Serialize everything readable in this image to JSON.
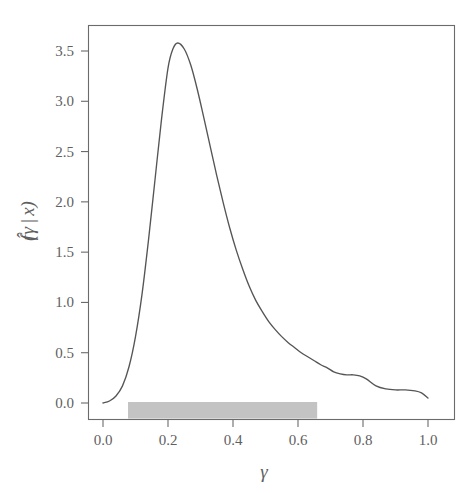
{
  "figure": {
    "background_color": "#ffffff",
    "frame_color": "#6b6b6b",
    "text_color": "#5f5f5f"
  },
  "chart_data": {
    "type": "line",
    "title": "",
    "subtitle": "",
    "xlabel": "γ",
    "ylabel": "f̂(γ | x)",
    "ylabel_parts": {
      "function": "f",
      "hat": "̂",
      "open_paren": "(",
      "variable": "γ",
      "bar": "|",
      "conditional": "x",
      "close_paren": ")"
    },
    "xlim": [
      -0.04,
      1.06
    ],
    "ylim": [
      -0.16,
      3.78
    ],
    "xticks": [
      0.0,
      0.2,
      0.4,
      0.6,
      0.8,
      1.0
    ],
    "xticklabels": [
      "0.0",
      "0.2",
      "0.4",
      "0.6",
      "0.8",
      "1.0"
    ],
    "yticks": [
      0.0,
      0.5,
      1.0,
      1.5,
      2.0,
      2.5,
      3.0,
      3.5
    ],
    "yticklabels": [
      "0.0",
      "0.5",
      "1.0",
      "1.5",
      "2.0",
      "2.5",
      "3.0",
      "3.5"
    ],
    "grid": false,
    "legend": null,
    "legend_position": "none",
    "series": [
      {
        "name": "posterior density",
        "color": "#555555",
        "line_width": 1.35,
        "x": [
          0.0,
          0.02,
          0.04,
          0.06,
          0.08,
          0.1,
          0.12,
          0.14,
          0.16,
          0.18,
          0.2,
          0.215,
          0.23,
          0.25,
          0.27,
          0.29,
          0.31,
          0.33,
          0.35,
          0.37,
          0.39,
          0.41,
          0.43,
          0.45,
          0.47,
          0.49,
          0.51,
          0.53,
          0.55,
          0.57,
          0.59,
          0.61,
          0.63,
          0.65,
          0.67,
          0.69,
          0.71,
          0.73,
          0.75,
          0.77,
          0.79,
          0.81,
          0.84,
          0.87,
          0.9,
          0.93,
          0.96,
          0.98,
          1.0
        ],
        "y": [
          0.0,
          0.02,
          0.07,
          0.17,
          0.36,
          0.66,
          1.08,
          1.62,
          2.22,
          2.82,
          3.33,
          3.52,
          3.58,
          3.52,
          3.36,
          3.12,
          2.84,
          2.55,
          2.26,
          1.99,
          1.74,
          1.52,
          1.33,
          1.16,
          1.02,
          0.91,
          0.81,
          0.73,
          0.66,
          0.6,
          0.55,
          0.5,
          0.46,
          0.42,
          0.38,
          0.35,
          0.31,
          0.29,
          0.28,
          0.28,
          0.27,
          0.24,
          0.17,
          0.14,
          0.13,
          0.13,
          0.12,
          0.1,
          0.05
        ]
      }
    ],
    "annotations": [
      {
        "name": "credible-interval-bar",
        "type": "shaded_rect",
        "x_start": 0.077,
        "x_end": 0.659,
        "y_start": -0.155,
        "y_end": 0.01,
        "color": "#c3c3c3",
        "label": ""
      }
    ],
    "peak": {
      "x": 0.225,
      "y": 3.58
    }
  }
}
